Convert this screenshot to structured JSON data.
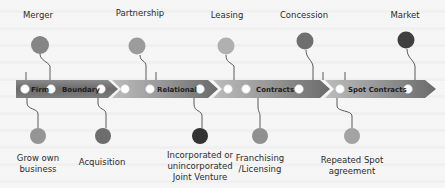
{
  "diagram": {
    "colors": {
      "band_dark": "#6e6e6e",
      "band_mid": "#9a9a9a",
      "band_light": "#b9b9b9",
      "band_highlight": "#d3d3d3",
      "ring": "#ffffff",
      "background": "#f5f5f5",
      "text": "#2b2b2b"
    },
    "band_segments": [
      {
        "label": "Firm",
        "x": 20,
        "width": 42
      },
      {
        "label": "Boundary",
        "x": 62,
        "width": 54
      },
      {
        "label": "",
        "x": 116,
        "width": 4
      },
      {
        "label": "Relational",
        "x": 120,
        "width": 100
      },
      {
        "label": "Contracts",
        "x": 220,
        "width": 100
      },
      {
        "label": "Spot Contracts",
        "x": 320,
        "width": 110
      }
    ],
    "band_labels": [
      {
        "text": "Firm",
        "x": 33
      },
      {
        "text": "Boundary",
        "x": 70
      },
      {
        "text": "Relational",
        "x": 152
      },
      {
        "text": "Contracts",
        "x": 255
      },
      {
        "text": "Spot Contracts",
        "x": 350
      }
    ],
    "top_items": [
      {
        "label": "Merger",
        "x": 38,
        "y_label": 16,
        "y_dot": 45,
        "color": "#858585"
      },
      {
        "label": "Partnership",
        "x": 140,
        "y_label": 14,
        "y_dot": 46,
        "color": "#9c9c9c"
      },
      {
        "label": "Leasing",
        "x": 227,
        "y_label": 16,
        "y_dot": 46,
        "color": "#b0b0b0"
      },
      {
        "label": "Concession",
        "x": 304,
        "y_label": 16,
        "y_dot": 40,
        "color": "#6f6f6f"
      },
      {
        "label": "Market",
        "x": 405,
        "y_label": 16,
        "y_dot": 40,
        "color": "#3f3f3f"
      }
    ],
    "bottom_items": [
      {
        "label": "Grow own business",
        "x": 39,
        "y_dot": 136,
        "color": "#959595"
      },
      {
        "label": "Acquisition",
        "x": 102,
        "y_dot": 136,
        "color": "#6d6d6d"
      },
      {
        "label": "Incorporated or unincorporated Joint Venture",
        "x": 200,
        "y_dot": 136,
        "color": "#333333"
      },
      {
        "label": "Franchising /Licensing",
        "x": 260,
        "y_dot": 136,
        "color": "#909090"
      },
      {
        "label": "Repeated Spot agreement",
        "x": 353,
        "y_dot": 136,
        "color": "#a3a3a3"
      }
    ]
  }
}
